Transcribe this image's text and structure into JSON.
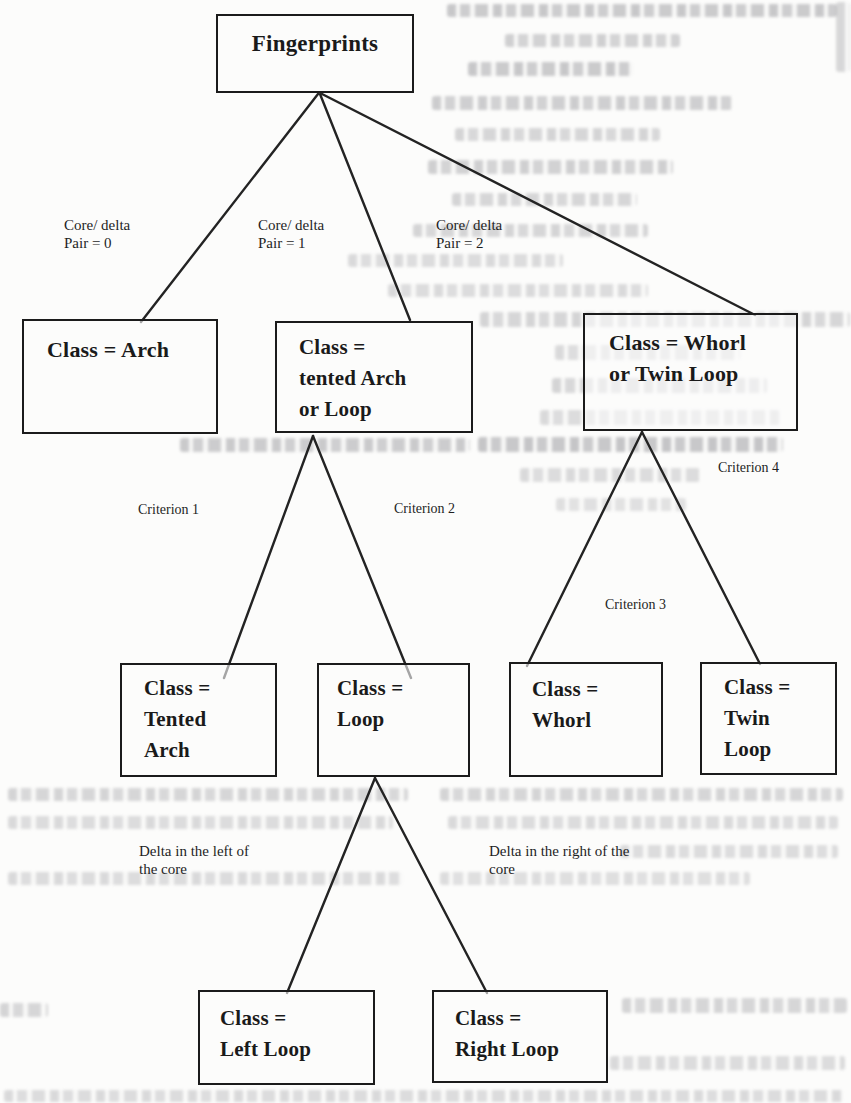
{
  "diagram": {
    "type": "decision-tree",
    "colors": {
      "ink": "#1a1a1a",
      "paper": "#fcfcfb",
      "bleed_artifact": "#7a7a80"
    },
    "nodes": {
      "fingerprints": {
        "lines": [
          "Fingerprints"
        ]
      },
      "arch": {
        "lines": [
          "Class = Arch"
        ]
      },
      "tented_arch_or_loop": {
        "lines": [
          "Class =",
          "tented Arch",
          "or Loop"
        ]
      },
      "whorl_or_twin_loop": {
        "lines": [
          "Class = Whorl",
          "or Twin Loop"
        ]
      },
      "tented_arch": {
        "lines": [
          "Class =",
          "Tented",
          "Arch"
        ]
      },
      "loop": {
        "lines": [
          "Class =",
          "Loop"
        ]
      },
      "whorl": {
        "lines": [
          "Class =",
          "Whorl"
        ]
      },
      "twin_loop": {
        "lines": [
          "Class =",
          "Twin",
          "Loop"
        ]
      },
      "left_loop": {
        "lines": [
          "Class =",
          "Left Loop"
        ]
      },
      "right_loop": {
        "lines": [
          "Class =",
          "Right Loop"
        ]
      }
    },
    "edge_labels": {
      "core_delta_0": {
        "lines": [
          "Core/ delta",
          "Pair = 0"
        ]
      },
      "core_delta_1": {
        "lines": [
          "Core/ delta",
          "Pair = 1"
        ]
      },
      "core_delta_2": {
        "lines": [
          "Core/ delta",
          "Pair = 2"
        ]
      },
      "criterion_1": {
        "text": "Criterion 1"
      },
      "criterion_2": {
        "text": "Criterion 2"
      },
      "criterion_3": {
        "text": "Criterion 3"
      },
      "criterion_4": {
        "text": "Criterion 4"
      },
      "delta_left": {
        "lines": [
          "Delta in the left of",
          "the core"
        ]
      },
      "delta_right": {
        "lines": [
          "Delta in the right of the",
          "core"
        ]
      }
    }
  }
}
